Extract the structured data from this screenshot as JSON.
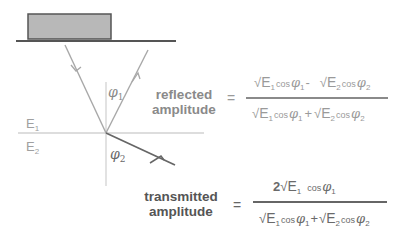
{
  "diagram": {
    "media": {
      "upper": {
        "symbol": "E",
        "index": "1"
      },
      "lower": {
        "symbol": "E",
        "index": "2"
      }
    },
    "angles": {
      "incident": {
        "symbol": "φ",
        "index": "1"
      },
      "transmitted": {
        "symbol": "φ",
        "index": "2"
      }
    }
  },
  "equations": {
    "reflected": {
      "label_line1": "reflected",
      "label_line2": "amplitude",
      "equals": "=",
      "numerator": {
        "t1": {
          "sqrt": "√",
          "E": "E",
          "Ei": "1",
          "cos": "cos",
          "phi": "φ",
          "pi": "1"
        },
        "op": "-",
        "t2": {
          "sqrt": "√",
          "E": "E",
          "Ei": "2",
          "cos": "cos",
          "phi": "φ",
          "pi": "2"
        }
      },
      "denominator": {
        "t1": {
          "sqrt": "√",
          "E": "E",
          "Ei": "1",
          "cos": "cos",
          "phi": "φ",
          "pi": "1"
        },
        "op": "+",
        "t2": {
          "sqrt": "√",
          "E": "E",
          "Ei": "2",
          "cos": "cos",
          "phi": "φ",
          "pi": "2"
        }
      }
    },
    "transmitted": {
      "label_line1": "transmitted",
      "label_line2": "amplitude",
      "equals": "=",
      "numerator": {
        "coef": "2",
        "t1": {
          "sqrt": "√",
          "E": "E",
          "Ei": "1",
          "cos": "cos",
          "phi": "φ",
          "pi": "1"
        }
      },
      "denominator": {
        "t1": {
          "sqrt": "√",
          "E": "E",
          "Ei": "1",
          "cos": "cos",
          "phi": "φ",
          "pi": "1"
        },
        "op": "+",
        "t2": {
          "sqrt": "√",
          "E": "E",
          "Ei": "2",
          "cos": "cos",
          "phi": "φ",
          "pi": "2"
        }
      }
    }
  },
  "colors": {
    "source_block_fill": "#b8b8b8",
    "source_block_stroke": "#555555",
    "ray_light": "#a8a8a8",
    "ray_dark": "#666666",
    "interface": "#cfcfcf"
  }
}
